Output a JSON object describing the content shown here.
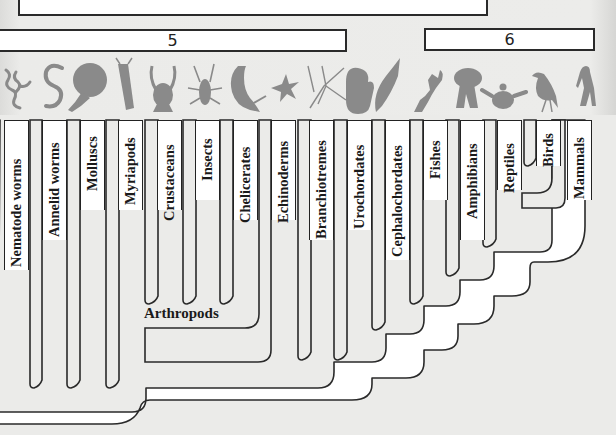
{
  "diagram": {
    "answer_boxes": [
      {
        "id": "top",
        "label": ""
      },
      {
        "id": "5",
        "label": "5"
      },
      {
        "id": "6",
        "label": "6"
      }
    ],
    "taxa": [
      {
        "name": "Nematode worms",
        "icon": "nematode-silhouette"
      },
      {
        "name": "Annelid worms",
        "icon": "annelid-silhouette"
      },
      {
        "name": "Molluscs",
        "icon": "nautilus-silhouette"
      },
      {
        "name": "Myriapods",
        "icon": "centipede-silhouette"
      },
      {
        "name": "Crustaceans",
        "icon": "lobster-silhouette"
      },
      {
        "name": "Insects",
        "icon": "insect-silhouette"
      },
      {
        "name": "Chelicerates",
        "icon": "scorpion-silhouette"
      },
      {
        "name": "Echinoderms",
        "icon": "starfish-silhouette"
      },
      {
        "name": "Branchiotremes",
        "icon": "branchiotreme-silhouette"
      },
      {
        "name": "Urochordates",
        "icon": "sea-squirt-silhouette"
      },
      {
        "name": "Cephalochordates",
        "icon": "lancelet-silhouette"
      },
      {
        "name": "Fishes",
        "icon": "fish-silhouette"
      },
      {
        "name": "Amphibians",
        "icon": "amphibian-silhouette"
      },
      {
        "name": "Reptiles",
        "icon": "turtle-silhouette"
      },
      {
        "name": "Birds",
        "icon": "bird-silhouette"
      },
      {
        "name": "Mammals",
        "icon": "human-silhouette"
      }
    ],
    "clades": [
      {
        "name": "Arthropods",
        "members": [
          "Myriapods",
          "Crustaceans",
          "Insects",
          "Chelicerates"
        ]
      }
    ],
    "colors": {
      "background": "#e8e8e6",
      "branch_fill": "#ffffff",
      "branch_stroke": "#2a2a2a",
      "silhouette": "#8a8a8a"
    }
  }
}
